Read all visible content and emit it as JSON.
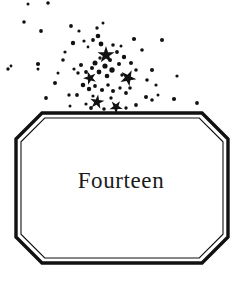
{
  "page": {
    "width": 242,
    "height": 283,
    "background_color": "#ffffff",
    "ink_color": "#111111"
  },
  "chapter": {
    "title": "Fourteen",
    "title_color": "#1a1a1a"
  },
  "frame": {
    "shape": "octagon-cut-corner",
    "style": "double-rule",
    "outer_color": "#111111",
    "inner_color": "#111111",
    "fill_color": "#ffffff",
    "bounds": {
      "x": 16,
      "y": 113,
      "width": 212,
      "height": 150
    },
    "corner_cut": 26
  },
  "decoration": {
    "name": "star-burst-spray",
    "description": "scattered stars and dots fanning up and to the left above the frame",
    "dot_color": "#111111",
    "star_color": "#111111",
    "big_stars": [
      {
        "cx": 106,
        "cy": 55,
        "r": 9
      },
      {
        "cx": 128,
        "cy": 78,
        "r": 8.5
      },
      {
        "cx": 90,
        "cy": 78,
        "r": 7
      },
      {
        "cx": 97,
        "cy": 102,
        "r": 7.5
      },
      {
        "cx": 116,
        "cy": 107,
        "r": 7
      }
    ],
    "dots": [
      {
        "cx": 28,
        "cy": 4,
        "r": 1.5
      },
      {
        "cx": 48,
        "cy": 3,
        "r": 1.8
      },
      {
        "cx": 24,
        "cy": 22,
        "r": 1.8
      },
      {
        "cx": 41,
        "cy": 31,
        "r": 1.9
      },
      {
        "cx": 71,
        "cy": 26,
        "r": 1.9
      },
      {
        "cx": 73,
        "cy": 43,
        "r": 2.2
      },
      {
        "cx": 79,
        "cy": 31,
        "r": 1.6
      },
      {
        "cx": 8,
        "cy": 69,
        "r": 1.7
      },
      {
        "cx": 11,
        "cy": 66,
        "r": 1.4
      },
      {
        "cx": 38,
        "cy": 64,
        "r": 2.1
      },
      {
        "cx": 38,
        "cy": 69,
        "r": 1.5
      },
      {
        "cx": 55,
        "cy": 83,
        "r": 2.0
      },
      {
        "cx": 46,
        "cy": 98,
        "r": 1.9
      },
      {
        "cx": 63,
        "cy": 60,
        "r": 1.8
      },
      {
        "cx": 65,
        "cy": 52,
        "r": 1.6
      },
      {
        "cx": 84,
        "cy": 41,
        "r": 1.6
      },
      {
        "cx": 88,
        "cy": 47,
        "r": 1.4
      },
      {
        "cx": 93,
        "cy": 40,
        "r": 1.9
      },
      {
        "cx": 98,
        "cy": 36,
        "r": 2.3
      },
      {
        "cx": 101,
        "cy": 44,
        "r": 2.4
      },
      {
        "cx": 95,
        "cy": 63,
        "r": 2.5
      },
      {
        "cx": 100,
        "cy": 58,
        "r": 1.7
      },
      {
        "cx": 105,
        "cy": 66,
        "r": 2.6
      },
      {
        "cx": 110,
        "cy": 60,
        "r": 2.0
      },
      {
        "cx": 112,
        "cy": 70,
        "r": 2.7
      },
      {
        "cx": 107,
        "cy": 76,
        "r": 2.3
      },
      {
        "cx": 99,
        "cy": 72,
        "r": 2.4
      },
      {
        "cx": 92,
        "cy": 68,
        "r": 2.0
      },
      {
        "cx": 86,
        "cy": 72,
        "r": 1.9
      },
      {
        "cx": 81,
        "cy": 65,
        "r": 2.0
      },
      {
        "cx": 78,
        "cy": 73,
        "r": 1.7
      },
      {
        "cx": 74,
        "cy": 69,
        "r": 1.6
      },
      {
        "cx": 83,
        "cy": 85,
        "r": 2.3
      },
      {
        "cx": 89,
        "cy": 89,
        "r": 2.2
      },
      {
        "cx": 95,
        "cy": 86,
        "r": 1.9
      },
      {
        "cx": 102,
        "cy": 90,
        "r": 2.1
      },
      {
        "cx": 108,
        "cy": 85,
        "r": 1.8
      },
      {
        "cx": 113,
        "cy": 91,
        "r": 2.0
      },
      {
        "cx": 120,
        "cy": 88,
        "r": 1.7
      },
      {
        "cx": 126,
        "cy": 93,
        "r": 1.9
      },
      {
        "cx": 119,
        "cy": 64,
        "r": 2.0
      },
      {
        "cx": 124,
        "cy": 57,
        "r": 2.2
      },
      {
        "cx": 131,
        "cy": 63,
        "r": 2.0
      },
      {
        "cx": 136,
        "cy": 70,
        "r": 1.8
      },
      {
        "cx": 130,
        "cy": 88,
        "r": 1.8
      },
      {
        "cx": 122,
        "cy": 75,
        "r": 1.7
      },
      {
        "cx": 117,
        "cy": 52,
        "r": 1.9
      },
      {
        "cx": 113,
        "cy": 45,
        "r": 1.8
      },
      {
        "cx": 121,
        "cy": 46,
        "r": 1.5
      },
      {
        "cx": 97,
        "cy": 28,
        "r": 1.7
      },
      {
        "cx": 103,
        "cy": 23,
        "r": 1.5
      },
      {
        "cx": 134,
        "cy": 39,
        "r": 2.1
      },
      {
        "cx": 142,
        "cy": 50,
        "r": 1.8
      },
      {
        "cx": 152,
        "cy": 70,
        "r": 2.0
      },
      {
        "cx": 147,
        "cy": 80,
        "r": 1.8
      },
      {
        "cx": 156,
        "cy": 85,
        "r": 1.6
      },
      {
        "cx": 146,
        "cy": 97,
        "r": 2.0
      },
      {
        "cx": 152,
        "cy": 100,
        "r": 1.8
      },
      {
        "cx": 158,
        "cy": 95,
        "r": 1.5
      },
      {
        "cx": 162,
        "cy": 40,
        "r": 2.0
      },
      {
        "cx": 174,
        "cy": 99,
        "r": 2.1
      },
      {
        "cx": 197,
        "cy": 103,
        "r": 1.9
      },
      {
        "cx": 177,
        "cy": 76,
        "r": 1.6
      },
      {
        "cx": 136,
        "cy": 105,
        "r": 1.9
      },
      {
        "cx": 126,
        "cy": 108,
        "r": 1.7
      },
      {
        "cx": 104,
        "cy": 109,
        "r": 1.8
      },
      {
        "cx": 91,
        "cy": 108,
        "r": 1.9
      },
      {
        "cx": 86,
        "cy": 104,
        "r": 1.6
      },
      {
        "cx": 69,
        "cy": 95,
        "r": 1.7
      },
      {
        "cx": 58,
        "cy": 73,
        "r": 1.5
      },
      {
        "cx": 70,
        "cy": 106,
        "r": 1.5
      },
      {
        "cx": 93,
        "cy": 96,
        "r": 1.6
      },
      {
        "cx": 111,
        "cy": 98,
        "r": 1.7
      },
      {
        "cx": 77,
        "cy": 95,
        "r": 1.9
      }
    ]
  }
}
